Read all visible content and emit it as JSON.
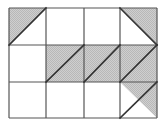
{
  "figure": {
    "type": "grid-diagram",
    "columns": 4,
    "rows": 3,
    "grid_geometry": {
      "left": 9,
      "top": 8,
      "right": 157,
      "bottom": 118,
      "column_edges": [
        9,
        46,
        84,
        120,
        157
      ],
      "row_edges": [
        8,
        45,
        82,
        118
      ]
    },
    "colors": {
      "background": "#ffffff",
      "shading": "#c8c8c8",
      "grid_line": "#555555",
      "diagonal_line": "#333333"
    },
    "line_widths": {
      "grid": 1.2,
      "diagonal": 1.6
    },
    "cells": [
      {
        "id": "r1c1",
        "row": 1,
        "col": 1,
        "fill": "half",
        "shaded_part": "upper-left",
        "diagonal": "bottom-left-to-top-right",
        "label": "cell-row1-col1-upper-left-shaded"
      },
      {
        "id": "r1c2",
        "row": 1,
        "col": 2,
        "fill": "none",
        "shaded_part": "none",
        "diagonal": "none",
        "label": "cell-row1-col2-empty"
      },
      {
        "id": "r1c3",
        "row": 1,
        "col": 3,
        "fill": "none",
        "shaded_part": "none",
        "diagonal": "none",
        "label": "cell-row1-col3-empty"
      },
      {
        "id": "r1c4",
        "row": 1,
        "col": 4,
        "fill": "half",
        "shaded_part": "upper-right",
        "diagonal": "top-left-to-bottom-right",
        "label": "cell-row1-col4-upper-right-shaded"
      },
      {
        "id": "r2c1",
        "row": 2,
        "col": 1,
        "fill": "none",
        "shaded_part": "none",
        "diagonal": "none",
        "label": "cell-row2-col1-empty"
      },
      {
        "id": "r2c2",
        "row": 2,
        "col": 2,
        "fill": "full",
        "shaded_part": "whole",
        "diagonal": "bottom-left-to-top-right",
        "label": "cell-row2-col2-full-shaded"
      },
      {
        "id": "r2c3",
        "row": 2,
        "col": 3,
        "fill": "full",
        "shaded_part": "whole",
        "diagonal": "bottom-left-to-top-right",
        "label": "cell-row2-col3-full-shaded"
      },
      {
        "id": "r2c4",
        "row": 2,
        "col": 4,
        "fill": "full",
        "shaded_part": "whole",
        "diagonal": "bottom-left-to-top-right",
        "label": "cell-row2-col4-full-shaded"
      },
      {
        "id": "r3c1",
        "row": 3,
        "col": 1,
        "fill": "none",
        "shaded_part": "none",
        "diagonal": "none",
        "label": "cell-row3-col1-empty"
      },
      {
        "id": "r3c2",
        "row": 3,
        "col": 2,
        "fill": "none",
        "shaded_part": "none",
        "diagonal": "none",
        "label": "cell-row3-col2-empty"
      },
      {
        "id": "r3c3",
        "row": 3,
        "col": 3,
        "fill": "none",
        "shaded_part": "none",
        "diagonal": "none",
        "label": "cell-row3-col3-empty"
      },
      {
        "id": "r3c4",
        "row": 3,
        "col": 4,
        "fill": "half",
        "shaded_part": "upper-right",
        "diagonal": "bottom-left-to-top-right",
        "label": "cell-row3-col4-upper-right-shaded"
      }
    ]
  }
}
